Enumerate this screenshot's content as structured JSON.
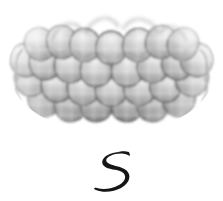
{
  "page": {
    "width": 223,
    "height": 201,
    "background_color": "#ffffff",
    "kind": "scanned-book-illustration",
    "description": "Grayscale halftone illustration of an arched mass of overlapping fish-scale / roof-shingle shapes, with a hand-drawn numeral below it"
  },
  "figure": {
    "name": "scale-pattern-arch",
    "label": "Arched overlapping scale pattern",
    "rows": 4,
    "columns": 7,
    "bounds": {
      "x": 14,
      "y": 8,
      "width": 196,
      "height": 122
    },
    "arch_rise": 34,
    "texture": "halftone-dots",
    "colors": {
      "scale_light": "#d8d8d8",
      "scale_mid": "#9a9a9a",
      "scale_dark": "#6a6a6a",
      "outline": "#2b2b2b",
      "shadow": "#4a4a4a",
      "paper": "#ffffff"
    }
  },
  "caption": {
    "numeral": "5",
    "style": "hand-drawn-brush",
    "color": "#151515",
    "bounds": {
      "x": 98,
      "y": 150,
      "width": 34,
      "height": 42
    }
  }
}
